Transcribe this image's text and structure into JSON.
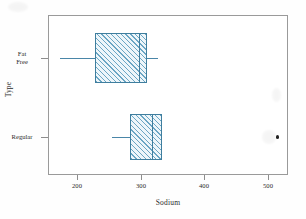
{
  "chart_data": {
    "type": "box",
    "title": "",
    "xlabel": "Sodium",
    "ylabel": "Type",
    "orientation": "horizontal",
    "grid": false,
    "legend": "none",
    "xlim": [
      110,
      545
    ],
    "xticks": [
      200,
      300,
      400,
      500
    ],
    "xtick_labels": [
      "200",
      "300",
      "400",
      "500"
    ],
    "categories": [
      "Fat Free",
      "Regular"
    ],
    "boxes": [
      {
        "category": "Fat Free",
        "label_lines": "Fat\nFree",
        "min": 173,
        "q1": 228,
        "median": 297,
        "q3": 310,
        "max": 327,
        "outliers": []
      },
      {
        "category": "Regular",
        "label_lines": "Regular",
        "min": 255,
        "q1": 283,
        "median": 317,
        "q3": 333,
        "max": 333,
        "outliers": [
          513
        ]
      }
    ],
    "colors": {
      "box_edge": "#3f7e9e",
      "box_hatch": "#6ba6c4",
      "box_fill": "#eef6fa",
      "whisker": "#4a86a8",
      "outlier": "#222222",
      "frame": "#9a9a9a",
      "text": "#2b2b2b"
    }
  }
}
